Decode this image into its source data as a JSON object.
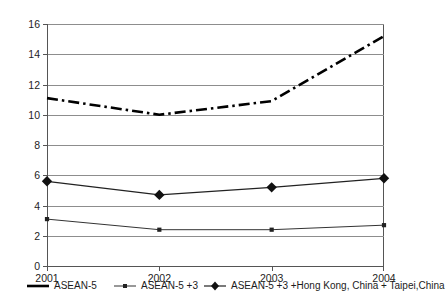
{
  "chart_data": {
    "type": "line",
    "title": "",
    "xlabel": "",
    "ylabel": "",
    "categories": [
      "2001",
      "2002",
      "2003",
      "2004"
    ],
    "x": [
      2001,
      2002,
      2003,
      2004
    ],
    "ylim": [
      0,
      16
    ],
    "ytick_step": 2,
    "yticks": [
      "0",
      "2",
      "4",
      "6",
      "8",
      "10",
      "12",
      "14",
      "16"
    ],
    "grid": true,
    "legend_position": "bottom",
    "series": [
      {
        "name": "ASEAN-5",
        "values": [
          11.1,
          10.0,
          10.9,
          15.2
        ],
        "line_style": "dash-dot",
        "marker": "none",
        "color": "#000000",
        "width": 2.6
      },
      {
        "name": "ASEAN-5 +3",
        "values": [
          3.1,
          2.4,
          2.4,
          2.7
        ],
        "line_style": "solid",
        "marker": "square",
        "color": "#333333",
        "width": 1
      },
      {
        "name": "ASEAN-5 +3 +Hong Kong, China + Taipei,China",
        "values": [
          5.6,
          4.7,
          5.2,
          5.8
        ],
        "line_style": "solid",
        "marker": "diamond",
        "color": "#222222",
        "width": 1.2
      }
    ]
  },
  "legend": {
    "entries": [
      {
        "label": "ASEAN-5"
      },
      {
        "label": "ASEAN-5 +3"
      },
      {
        "label": "ASEAN-5 +3 +Hong Kong, China + Taipei,China"
      }
    ]
  },
  "axes": {
    "y_labels": [
      "16",
      "14",
      "12",
      "10",
      "8",
      "6",
      "4",
      "2",
      "0"
    ],
    "x_labels": [
      "2001",
      "2002",
      "2003",
      "2004"
    ]
  },
  "title_remnant": ""
}
